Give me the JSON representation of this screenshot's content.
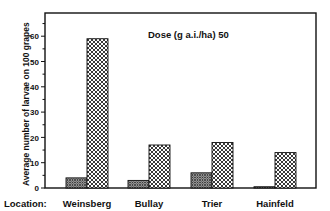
{
  "chart_data": {
    "type": "bar",
    "title": "Dose (g a.i./ha) 50",
    "xlabel": "Location:",
    "ylabel": "Average number of larvae on 100 grapes",
    "categories": [
      "Weinsberg",
      "Bullay",
      "Trier",
      "Hainfeld"
    ],
    "series": [
      {
        "name": "treated",
        "pattern": "fine-dots",
        "values": [
          4,
          3,
          6,
          0.5
        ]
      },
      {
        "name": "untreated control",
        "pattern": "crosshatch",
        "values": [
          59,
          17,
          18,
          14
        ]
      }
    ],
    "yticks": [
      0,
      10,
      20,
      30,
      40,
      50,
      60
    ],
    "ylim": [
      0,
      69
    ],
    "grid": false,
    "legend": "none"
  }
}
